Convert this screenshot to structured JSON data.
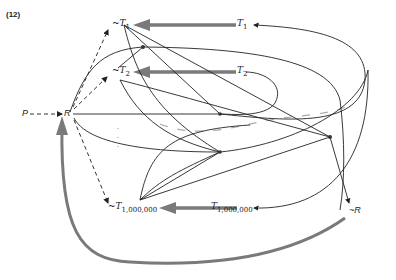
{
  "figure": {
    "number": "(12)",
    "nodes": {
      "P": {
        "label": "P"
      },
      "R": {
        "label": "R"
      },
      "notR": {
        "label": "~R"
      },
      "notT1": {
        "prefix": "~T",
        "sub": "1"
      },
      "notT2": {
        "prefix": "~T",
        "sub": "2"
      },
      "notTN": {
        "prefix": "~T",
        "sub": "1,000,000"
      },
      "T1": {
        "prefix": "T",
        "sub": "1"
      },
      "T2": {
        "prefix": "T",
        "sub": "2"
      },
      "TN": {
        "prefix": "T",
        "sub": "1,000,000"
      }
    },
    "colors": {
      "line": "#222222",
      "thick_arrow": "#7a7a7a",
      "dashed": "#333333",
      "faded": "#aaaaaa"
    }
  }
}
